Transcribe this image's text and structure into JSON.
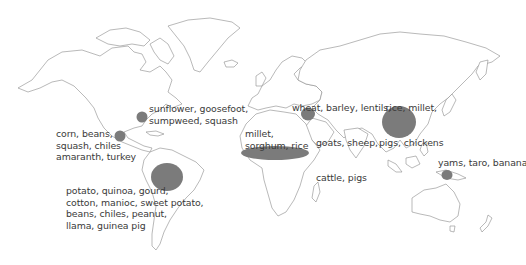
{
  "map": {
    "title": "Centers of plant and animal domestication",
    "colors": {
      "background": "#ffffff",
      "land_outline": "#8a8a8a",
      "center_fill": "#7b7b7b",
      "label_text": "#3a3a3a"
    },
    "centers": [
      {
        "id": "eastern-north-america",
        "label_lines": [
          "sunflower, goosefoot,",
          "sumpweed, squash"
        ],
        "label": "sunflower, goosefoot,\nsumpweed, squash",
        "shape": {
          "cx": 142,
          "cy": 117,
          "rx": 5.5,
          "ry": 5.5
        }
      },
      {
        "id": "mesoamerica",
        "label_lines": [
          "corn, beans,",
          "squash, chiles",
          "amaranth, turkey"
        ],
        "label": "corn, beans,\nsquash, chiles\namaranth, turkey",
        "shape": {
          "cx": 120,
          "cy": 136,
          "rx": 5.5,
          "ry": 5.5
        }
      },
      {
        "id": "south-america",
        "label_lines": [
          "potato, quinoa, gourd,",
          "cotton, manioc, sweet potato,",
          "beans, chiles, peanut,",
          "llama, guinea pig"
        ],
        "label": "potato, quinoa, gourd,\ncotton, manioc, sweet potato,\nbeans, chiles, peanut,\nllama, guinea pig",
        "shape": {
          "cx": 167,
          "cy": 177,
          "rx": 16,
          "ry": 14
        }
      },
      {
        "id": "sub-saharan-africa",
        "label_lines": [
          "millet,",
          "sorghum, rice"
        ],
        "label": "millet,\nsorghum, rice",
        "shape": {
          "cx": 275,
          "cy": 153,
          "rx": 34,
          "ry": 7
        }
      },
      {
        "id": "fertile-crescent",
        "label_lines": [
          "wheat, barley, lentils,",
          "goats, sheep,",
          "cattle, pigs"
        ],
        "label": "wheat, barley, lentils,\ngoats, sheep,\ncattle, pigs",
        "shape": {
          "cx": 308,
          "cy": 114,
          "rx": 7,
          "ry": 6.5
        }
      },
      {
        "id": "china",
        "label_lines": [
          "rice, millet,",
          "pigs, chickens"
        ],
        "label": "rice, millet,\npigs, chickens",
        "shape": {
          "cx": 399,
          "cy": 122,
          "rx": 17,
          "ry": 16
        }
      },
      {
        "id": "new-guinea",
        "label_lines": [
          "yams, taro, banana"
        ],
        "label": "yams, taro, banana",
        "shape": {
          "cx": 447,
          "cy": 175,
          "rx": 5.5,
          "ry": 5
        }
      }
    ]
  }
}
